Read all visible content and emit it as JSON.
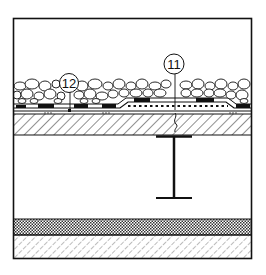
{
  "diagram": {
    "type": "roof-section-detail",
    "colors": {
      "line": "#111111",
      "background": "#ffffff"
    },
    "frame": {
      "x": 13,
      "y": 18,
      "width": 239,
      "height": 241
    },
    "layers": [
      {
        "name": "gravel-ballast",
        "y_top": 80,
        "y_bottom": 103
      },
      {
        "name": "waterproofing-membrane",
        "y_top": 103,
        "y_bottom": 113
      },
      {
        "name": "concrete-slab",
        "y_top": 114,
        "y_bottom": 135,
        "fill": "diagonal-hatch"
      },
      {
        "name": "open-space",
        "y_top": 135,
        "y_bottom": 219
      },
      {
        "name": "insulation-layer",
        "y_top": 219,
        "y_bottom": 235,
        "fill": "dot-pattern"
      },
      {
        "name": "base-layer",
        "y_top": 235,
        "y_bottom": 259,
        "fill": "diagonal-hatch"
      }
    ],
    "i_beam": {
      "x_center": 174,
      "flange_left": 156,
      "flange_right": 192,
      "y_top": 136,
      "y_bottom": 198
    },
    "callouts": [
      {
        "id": "callout-11",
        "label": "11",
        "cx": 174,
        "cy": 64,
        "r": 10,
        "leader_to_y": 110
      },
      {
        "id": "callout-12",
        "label": "12",
        "cx": 69,
        "cy": 83,
        "r": 9,
        "leader_to_y": 111
      }
    ]
  }
}
